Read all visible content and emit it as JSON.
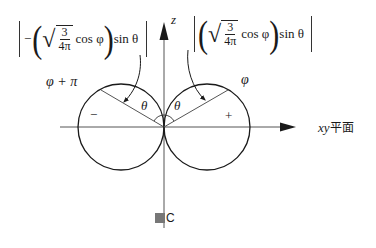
{
  "figure": {
    "caption": "圖C",
    "caption_glyph": "圖",
    "caption_letter": "C"
  },
  "axes": {
    "z_label": "z",
    "xy_label_latin": "xy",
    "xy_label_cjk": "平面"
  },
  "lobes": {
    "left": {
      "sign": "−",
      "angle_label": "φ + π",
      "theta_label": "θ"
    },
    "right": {
      "sign": "+",
      "angle_label": "φ",
      "theta_label": "θ"
    }
  },
  "formulas": {
    "left": {
      "prefix": "−",
      "numerator": "3",
      "denominator": "4π",
      "func": "cos φ",
      "tail": "sin θ"
    },
    "right": {
      "numerator": "3",
      "denominator": "4π",
      "func": "cos φ",
      "tail": "sin θ"
    }
  },
  "colors": {
    "line": "#1a1a1a",
    "axis": "#555555",
    "caption_box": "#777777"
  }
}
